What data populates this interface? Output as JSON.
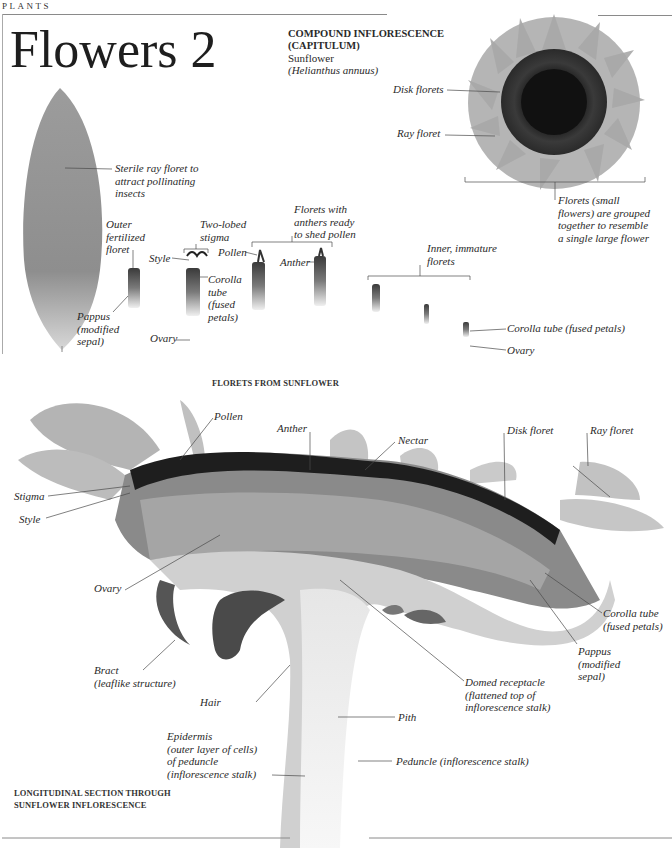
{
  "page": {
    "section": "PLANTS",
    "title": "Flowers 2"
  },
  "compound": {
    "heading_line1": "COMPOUND INFLORESCENCE",
    "heading_line2": "(CAPITULUM)",
    "common_name": "Sunflower",
    "latin_name": "(Helianthus annuus)",
    "labels": {
      "disk_florets": "Disk florets",
      "ray_floret": "Ray floret",
      "grouped": [
        "Florets (small",
        "flowers) are grouped",
        "together to resemble",
        "a single large flower"
      ]
    }
  },
  "florets": {
    "caption": "FLORETS FROM SUNFLOWER",
    "labels": {
      "sterile": [
        "Sterile ray floret to",
        "attract pollinating",
        "insects"
      ],
      "outer": [
        "Outer",
        "fertilized",
        "floret"
      ],
      "pappus": [
        "Pappus",
        "(modified",
        "sepal)"
      ],
      "two_lobed": [
        "Two-lobed",
        "stigma"
      ],
      "style": "Style",
      "corolla": [
        "Corolla",
        "tube",
        "(fused",
        "petals)"
      ],
      "ovary": "Ovary",
      "anthers_ready": [
        "Florets with",
        "anthers ready",
        "to shed pollen"
      ],
      "pollen": "Pollen",
      "anther": "Anther",
      "inner": [
        "Inner, immature",
        "florets"
      ],
      "corolla_tube_fused": "Corolla tube (fused petals)",
      "ovary2": "Ovary"
    }
  },
  "section": {
    "caption_line1": "LONGITUDINAL SECTION THROUGH",
    "caption_line2": "SUNFLOWER INFLORESCENCE",
    "labels": {
      "pollen": "Pollen",
      "anther": "Anther",
      "nectar": "Nectar",
      "disk_floret": "Disk floret",
      "ray_floret": "Ray floret",
      "stigma": "Stigma",
      "style": "Style",
      "ovary": "Ovary",
      "corolla": [
        "Corolla tube",
        "(fused petals)"
      ],
      "pappus": [
        "Pappus",
        "(modified",
        "sepal)"
      ],
      "bract": [
        "Bract",
        "(leaflike structure)"
      ],
      "domed": [
        "Domed receptacle",
        "(flattened top of",
        "inflorescence stalk)"
      ],
      "hair": "Hair",
      "pith": "Pith",
      "epidermis": [
        "Epidermis",
        "(outer layer of cells)",
        "of peduncle",
        "(inflorescence stalk)"
      ],
      "peduncle": "Peduncle (inflorescence stalk)"
    }
  }
}
